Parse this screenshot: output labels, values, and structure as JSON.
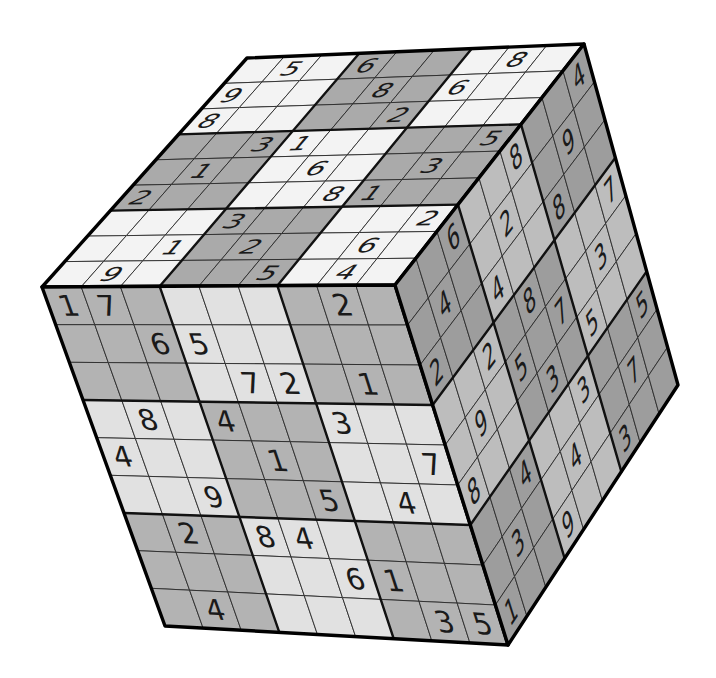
{
  "title": "Sudoku Cube",
  "colors": {
    "background": "#ffffff",
    "front_dark": "#b3b3b3",
    "front_light": "#e1e1e1",
    "top_dark": "#aaaaaa",
    "top_light": "#f3f3f3",
    "right_dark": "#9d9d9d",
    "right_light": "#bdbdbd",
    "digit": "#1a1a1a"
  },
  "faces": {
    "top": {
      "label": "Top face",
      "corners": {
        "tl": [
          247,
          58
        ],
        "tr": [
          584,
          44
        ],
        "bl": [
          42,
          287
        ],
        "br": [
          395,
          285
        ]
      },
      "shading": [
        "L",
        "D",
        "L",
        "D",
        "L",
        "D",
        "L",
        "D",
        "L"
      ],
      "italic": true,
      "grid": [
        [
          0,
          5,
          0,
          6,
          0,
          0,
          0,
          8,
          0
        ],
        [
          9,
          0,
          0,
          0,
          8,
          0,
          6,
          0,
          0
        ],
        [
          8,
          0,
          0,
          0,
          0,
          2,
          0,
          0,
          0
        ],
        [
          0,
          0,
          3,
          1,
          0,
          0,
          0,
          0,
          5
        ],
        [
          0,
          1,
          0,
          0,
          6,
          0,
          0,
          3,
          0
        ],
        [
          2,
          0,
          0,
          0,
          0,
          8,
          1,
          0,
          0
        ],
        [
          0,
          0,
          0,
          3,
          0,
          0,
          0,
          0,
          2
        ],
        [
          0,
          0,
          1,
          0,
          2,
          0,
          0,
          6,
          0
        ],
        [
          0,
          9,
          0,
          0,
          0,
          5,
          0,
          4,
          0
        ]
      ]
    },
    "front": {
      "label": "Front face",
      "corners": {
        "tl": [
          42,
          287
        ],
        "tr": [
          395,
          285
        ],
        "bl": [
          165,
          626
        ],
        "br": [
          508,
          645
        ]
      },
      "shading": [
        "D",
        "L",
        "D",
        "L",
        "D",
        "L",
        "D",
        "L",
        "D"
      ],
      "italic": false,
      "grid": [
        [
          1,
          7,
          0,
          0,
          0,
          0,
          0,
          2,
          0
        ],
        [
          0,
          0,
          6,
          5,
          0,
          0,
          0,
          0,
          0
        ],
        [
          0,
          0,
          0,
          0,
          7,
          2,
          0,
          1,
          0
        ],
        [
          0,
          8,
          0,
          4,
          0,
          0,
          3,
          0,
          0
        ],
        [
          4,
          0,
          0,
          0,
          1,
          0,
          0,
          0,
          7
        ],
        [
          0,
          0,
          9,
          0,
          0,
          5,
          0,
          4,
          0
        ],
        [
          0,
          2,
          0,
          8,
          4,
          0,
          0,
          0,
          0
        ],
        [
          0,
          0,
          0,
          0,
          0,
          6,
          1,
          0,
          0
        ],
        [
          0,
          4,
          0,
          0,
          0,
          0,
          0,
          3,
          5
        ]
      ]
    },
    "right": {
      "label": "Right face",
      "corners": {
        "tl": [
          395,
          285
        ],
        "tr": [
          584,
          44
        ],
        "bl": [
          508,
          645
        ],
        "br": [
          678,
          385
        ]
      },
      "shading": [
        "D",
        "L",
        "D",
        "L",
        "D",
        "L",
        "D",
        "L",
        "D"
      ],
      "italic": false,
      "grid": [
        [
          0,
          0,
          6,
          0,
          0,
          8,
          0,
          0,
          4
        ],
        [
          0,
          4,
          0,
          0,
          2,
          0,
          0,
          9,
          0
        ],
        [
          2,
          0,
          0,
          4,
          0,
          0,
          8,
          0,
          0
        ],
        [
          0,
          0,
          2,
          0,
          8,
          0,
          0,
          0,
          7
        ],
        [
          0,
          9,
          0,
          5,
          0,
          7,
          0,
          3,
          0
        ],
        [
          8,
          0,
          0,
          0,
          3,
          0,
          5,
          0,
          0
        ],
        [
          0,
          0,
          4,
          0,
          0,
          3,
          0,
          0,
          5
        ],
        [
          0,
          3,
          0,
          0,
          4,
          0,
          0,
          7,
          0
        ],
        [
          1,
          0,
          0,
          9,
          0,
          0,
          3,
          0,
          0
        ]
      ]
    }
  }
}
